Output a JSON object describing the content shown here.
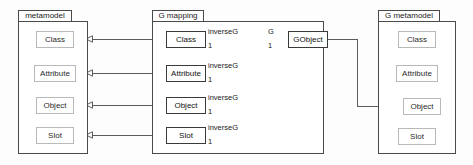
{
  "diagram": {
    "type": "uml-package-diagram",
    "background_color": "#fdfdfd",
    "line_color": "#4a4a4a",
    "pale_border_color": "#b9b9b9"
  },
  "packages": [
    {
      "id": "metamodel",
      "name": "metamodel",
      "classes": [
        {
          "id": "mm-class",
          "label": "Class"
        },
        {
          "id": "mm-attribute",
          "label": "Attribute"
        },
        {
          "id": "mm-object",
          "label": "Object"
        },
        {
          "id": "mm-slot",
          "label": "Slot"
        }
      ]
    },
    {
      "id": "g-mapping",
      "name": "G mapping",
      "classes": [
        {
          "id": "gm-class",
          "label": "Class",
          "role": "inverseG",
          "multiplicity": "1"
        },
        {
          "id": "gm-attribute",
          "label": "Attribute",
          "role": "inverseG",
          "multiplicity": "1"
        },
        {
          "id": "gm-object",
          "label": "Object",
          "role": "inverseG",
          "multiplicity": "1"
        },
        {
          "id": "gm-slot",
          "label": "Slot",
          "role": "inverseG",
          "multiplicity": "1"
        },
        {
          "id": "gm-gobject",
          "label": "GObject",
          "role": "G",
          "multiplicity": "1"
        }
      ]
    },
    {
      "id": "g-metamodel",
      "name": "G metamodel",
      "classes": [
        {
          "id": "gmm-class",
          "label": "Class"
        },
        {
          "id": "gmm-attribute",
          "label": "Attribute"
        },
        {
          "id": "gmm-object",
          "label": "Object"
        },
        {
          "id": "gmm-slot",
          "label": "Slot"
        }
      ]
    }
  ],
  "association_labels": {
    "inverseG": "inverseG",
    "g": "G",
    "one": "1"
  },
  "associations": [
    {
      "from": "gm-class",
      "to": "mm-class",
      "name": "inverseG",
      "multiplicity": "1",
      "arrow": "hollow-triangle"
    },
    {
      "from": "gm-attribute",
      "to": "mm-attribute",
      "name": "inverseG",
      "multiplicity": "1",
      "arrow": "hollow-triangle"
    },
    {
      "from": "gm-object",
      "to": "mm-object",
      "name": "inverseG",
      "multiplicity": "1",
      "arrow": "hollow-triangle"
    },
    {
      "from": "gm-slot",
      "to": "mm-slot",
      "name": "inverseG",
      "multiplicity": "1",
      "arrow": "hollow-triangle"
    },
    {
      "from": "gm-gobject",
      "to": "gmm-object",
      "name": "G",
      "multiplicity": "1",
      "arrow": "hollow-triangle"
    }
  ]
}
